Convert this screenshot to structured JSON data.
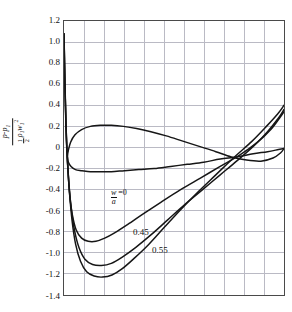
{
  "figure": {
    "background": "#ffffff",
    "frame_color": "#4a4a4a",
    "grid_color": "#b9b9c4",
    "curve_color": "#161616"
  },
  "axis": {
    "y_tick_labels": [
      "1.2",
      "1.0",
      "0.8",
      "0.6",
      "0.4",
      "0.2",
      "0",
      "-0.2",
      "-0.4",
      "-0.6",
      "-0.8",
      "-1.0",
      "-1.2",
      "-1.4"
    ],
    "y_title": {
      "numerator_p": "p",
      "numerator_minus": "-",
      "numerator_p1": "p",
      "numerator_p1_sub": "1",
      "den_half_num": "1",
      "den_half_den": "2",
      "den_rho": "ρ",
      "den_rho_sub": "1",
      "den_w": "w",
      "den_w_sub": "1",
      "den_w_sup": "2"
    }
  },
  "annotations": {
    "ratio_num": "w",
    "ratio_num_sub": "1",
    "ratio_den": "a",
    "ratio_den_sub": "1",
    "ratio_eq": "=0",
    "label_045": "0.45",
    "label_055": "0.55"
  },
  "chart_data": {
    "type": "line",
    "title": "",
    "xlabel": "",
    "ylabel": "(p - p1) / (1/2 rho1 w1^2)",
    "ylim": [
      -1.4,
      1.2
    ],
    "xlim": [
      0,
      1
    ],
    "y_ticks": [
      1.2,
      1.0,
      0.8,
      0.6,
      0.4,
      0.2,
      0.0,
      -0.2,
      -0.4,
      -0.6,
      -0.8,
      -1.0,
      -1.2,
      -1.4
    ],
    "grid": true,
    "grid_rows": 13,
    "grid_cols": 11,
    "x_tick_labels_shown": false,
    "legend_position": "inline-annotations",
    "series": [
      {
        "name": "w1/a1 = 0",
        "label": "=0",
        "points": [
          [
            0.0,
            1.08
          ],
          [
            0.004,
            0.62
          ],
          [
            0.008,
            0.26
          ],
          [
            0.012,
            0.02
          ],
          [
            0.018,
            -0.22
          ],
          [
            0.026,
            -0.45
          ],
          [
            0.038,
            -0.64
          ],
          [
            0.055,
            -0.78
          ],
          [
            0.08,
            -0.86
          ],
          [
            0.11,
            -0.89
          ],
          [
            0.145,
            -0.89
          ],
          [
            0.185,
            -0.86
          ],
          [
            0.23,
            -0.81
          ],
          [
            0.29,
            -0.73
          ],
          [
            0.36,
            -0.63
          ],
          [
            0.44,
            -0.52
          ],
          [
            0.53,
            -0.4
          ],
          [
            0.62,
            -0.29
          ],
          [
            0.71,
            -0.18
          ],
          [
            0.8,
            -0.07
          ],
          [
            0.88,
            0.05
          ],
          [
            0.94,
            0.17
          ],
          [
            0.98,
            0.28
          ],
          [
            1.0,
            0.34
          ]
        ]
      },
      {
        "name": "w1/a1 = 0.45",
        "label": "0.45",
        "points": [
          [
            0.0,
            1.08
          ],
          [
            0.004,
            0.6
          ],
          [
            0.009,
            0.22
          ],
          [
            0.014,
            -0.05
          ],
          [
            0.022,
            -0.33
          ],
          [
            0.033,
            -0.58
          ],
          [
            0.048,
            -0.79
          ],
          [
            0.068,
            -0.95
          ],
          [
            0.095,
            -1.06
          ],
          [
            0.13,
            -1.11
          ],
          [
            0.17,
            -1.12
          ],
          [
            0.215,
            -1.1
          ],
          [
            0.265,
            -1.04
          ],
          [
            0.325,
            -0.95
          ],
          [
            0.395,
            -0.83
          ],
          [
            0.47,
            -0.69
          ],
          [
            0.55,
            -0.54
          ],
          [
            0.63,
            -0.4
          ],
          [
            0.71,
            -0.26
          ],
          [
            0.79,
            -0.12
          ],
          [
            0.865,
            0.02
          ],
          [
            0.925,
            0.15
          ],
          [
            0.975,
            0.28
          ],
          [
            1.0,
            0.36
          ]
        ]
      },
      {
        "name": "w1/a1 = 0.55",
        "label": "0.55",
        "points": [
          [
            0.0,
            1.08
          ],
          [
            0.005,
            0.56
          ],
          [
            0.01,
            0.16
          ],
          [
            0.016,
            -0.13
          ],
          [
            0.025,
            -0.43
          ],
          [
            0.037,
            -0.7
          ],
          [
            0.053,
            -0.92
          ],
          [
            0.075,
            -1.08
          ],
          [
            0.103,
            -1.18
          ],
          [
            0.137,
            -1.22
          ],
          [
            0.175,
            -1.23
          ],
          [
            0.218,
            -1.21
          ],
          [
            0.265,
            -1.15
          ],
          [
            0.32,
            -1.05
          ],
          [
            0.385,
            -0.92
          ],
          [
            0.455,
            -0.76
          ],
          [
            0.53,
            -0.59
          ],
          [
            0.61,
            -0.42
          ],
          [
            0.69,
            -0.26
          ],
          [
            0.775,
            -0.09
          ],
          [
            0.855,
            0.06
          ],
          [
            0.92,
            0.2
          ],
          [
            0.972,
            0.32
          ],
          [
            1.0,
            0.4
          ]
        ]
      },
      {
        "name": "closed-profile-upper",
        "label": "",
        "points": [
          [
            0.018,
            -0.04
          ],
          [
            0.03,
            0.05
          ],
          [
            0.05,
            0.12
          ],
          [
            0.08,
            0.17
          ],
          [
            0.12,
            0.2
          ],
          [
            0.165,
            0.21
          ],
          [
            0.215,
            0.21
          ],
          [
            0.27,
            0.2
          ],
          [
            0.33,
            0.18
          ],
          [
            0.395,
            0.15
          ],
          [
            0.465,
            0.11
          ],
          [
            0.54,
            0.06
          ],
          [
            0.615,
            0.01
          ],
          [
            0.69,
            -0.04
          ],
          [
            0.76,
            -0.09
          ],
          [
            0.83,
            -0.12
          ],
          [
            0.895,
            -0.13
          ],
          [
            0.95,
            -0.1
          ],
          [
            0.985,
            -0.05
          ],
          [
            1.0,
            -0.01
          ]
        ]
      },
      {
        "name": "closed-profile-lower",
        "label": "",
        "points": [
          [
            0.018,
            -0.04
          ],
          [
            0.016,
            -0.09
          ],
          [
            0.02,
            -0.14
          ],
          [
            0.032,
            -0.18
          ],
          [
            0.052,
            -0.21
          ],
          [
            0.082,
            -0.22
          ],
          [
            0.12,
            -0.23
          ],
          [
            0.165,
            -0.23
          ],
          [
            0.215,
            -0.23
          ],
          [
            0.275,
            -0.22
          ],
          [
            0.34,
            -0.21
          ],
          [
            0.41,
            -0.2
          ],
          [
            0.485,
            -0.18
          ],
          [
            0.56,
            -0.16
          ],
          [
            0.635,
            -0.14
          ],
          [
            0.71,
            -0.11
          ],
          [
            0.785,
            -0.09
          ],
          [
            0.86,
            -0.06
          ],
          [
            0.925,
            -0.04
          ],
          [
            0.975,
            -0.02
          ],
          [
            1.0,
            -0.01
          ]
        ]
      }
    ]
  }
}
